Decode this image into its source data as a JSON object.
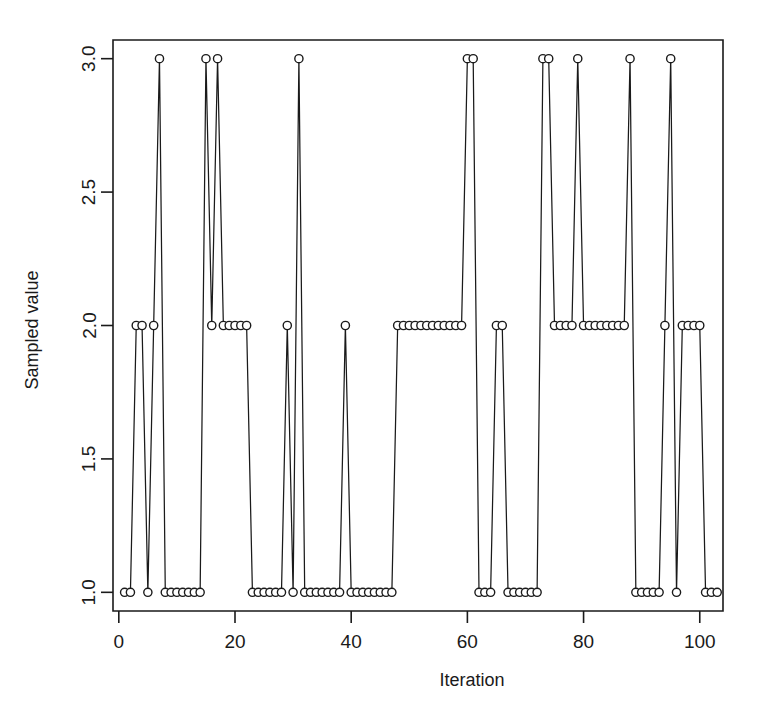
{
  "figure": {
    "name": "mcmc-trace-plot",
    "background_color": "#ffffff",
    "ink_color": "#1a1a1a"
  },
  "chart_data": {
    "type": "line",
    "title": "",
    "subtitle": "",
    "xlabel": "Iteration",
    "ylabel": "Sampled value",
    "xlim": [
      -1,
      104
    ],
    "ylim": [
      0.93,
      3.07
    ],
    "xticks": [
      0,
      20,
      40,
      60,
      80,
      100
    ],
    "xticklabels": [
      "0",
      "20",
      "40",
      "60",
      "80",
      "100"
    ],
    "yticks": [
      1.0,
      1.5,
      2.0,
      2.5,
      3.0
    ],
    "yticklabels": [
      "1.0",
      "1.5",
      "2.0",
      "2.5",
      "3.0"
    ],
    "grid": false,
    "legend": false,
    "marker": "open-circle",
    "series": [
      {
        "name": "sampled value",
        "x": [
          1,
          2,
          3,
          4,
          5,
          6,
          7,
          8,
          9,
          10,
          11,
          12,
          13,
          14,
          15,
          16,
          17,
          18,
          19,
          20,
          21,
          22,
          23,
          24,
          25,
          26,
          27,
          28,
          29,
          30,
          31,
          32,
          33,
          34,
          35,
          36,
          37,
          38,
          39,
          40,
          41,
          42,
          43,
          44,
          45,
          46,
          47,
          48,
          49,
          50,
          51,
          52,
          53,
          54,
          55,
          56,
          57,
          58,
          59,
          60,
          61,
          62,
          63,
          64,
          65,
          66,
          67,
          68,
          69,
          70,
          71,
          72,
          73,
          74,
          75,
          76,
          77,
          78,
          79,
          80,
          81,
          82,
          83,
          84,
          85,
          86,
          87,
          88,
          89,
          90,
          91,
          92,
          93,
          94,
          95,
          96,
          97,
          98,
          99,
          100,
          101,
          102,
          103
        ],
        "values": [
          1,
          1,
          2,
          2,
          1,
          2,
          3,
          1,
          1,
          1,
          1,
          1,
          1,
          1,
          3,
          2,
          3,
          2,
          2,
          2,
          2,
          2,
          1,
          1,
          1,
          1,
          1,
          1,
          2,
          1,
          3,
          1,
          1,
          1,
          1,
          1,
          1,
          1,
          2,
          1,
          1,
          1,
          1,
          1,
          1,
          1,
          1,
          2,
          2,
          2,
          2,
          2,
          2,
          2,
          2,
          2,
          2,
          2,
          2,
          3,
          3,
          1,
          1,
          1,
          2,
          2,
          1,
          1,
          1,
          1,
          1,
          1,
          3,
          3,
          2,
          2,
          2,
          2,
          3,
          2,
          2,
          2,
          2,
          2,
          2,
          2,
          2,
          3,
          1,
          1,
          1,
          1,
          1,
          2,
          3,
          1,
          2,
          2,
          2,
          2,
          1,
          1,
          1
        ]
      }
    ],
    "annotations": []
  },
  "axes": {
    "x_axis_label": "Iteration",
    "y_axis_label": "Sampled value"
  }
}
